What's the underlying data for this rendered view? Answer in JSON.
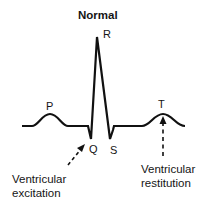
{
  "title": "Normal",
  "waves": {
    "p": "P",
    "q": "Q",
    "r": "R",
    "s": "S",
    "t": "T"
  },
  "annotations": {
    "excitation": {
      "line1": "Ventricular",
      "line2": "excitation",
      "points_to": "Q"
    },
    "restitution": {
      "line1": "Ventricular",
      "line2": "restitution",
      "points_to": "T"
    }
  },
  "colors": {
    "stroke": "#111111",
    "background": "#ffffff"
  }
}
